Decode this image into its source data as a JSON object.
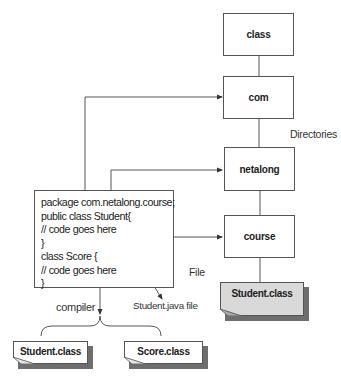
{
  "directories": {
    "label": "Directories",
    "boxes": [
      {
        "id": "class",
        "label": "class"
      },
      {
        "id": "com",
        "label": "com"
      },
      {
        "id": "netalong",
        "label": "netalong"
      },
      {
        "id": "course",
        "label": "course"
      }
    ],
    "output_file": {
      "label": "Student.class"
    }
  },
  "source_file": {
    "label": "File",
    "caption": "Student.java file",
    "code_lines": [
      "package com.netalong.course;",
      "public class Student{",
      "// code goes here",
      "}",
      "class Score {",
      "// code goes here",
      "}"
    ]
  },
  "compiler": {
    "label": "compiler",
    "outputs": [
      {
        "label": "Student.class"
      },
      {
        "label": "Score.class"
      }
    ]
  },
  "colors": {
    "line": "#555555",
    "gray_file": "#d9d9d9",
    "shadow": "#6e6e6e"
  }
}
